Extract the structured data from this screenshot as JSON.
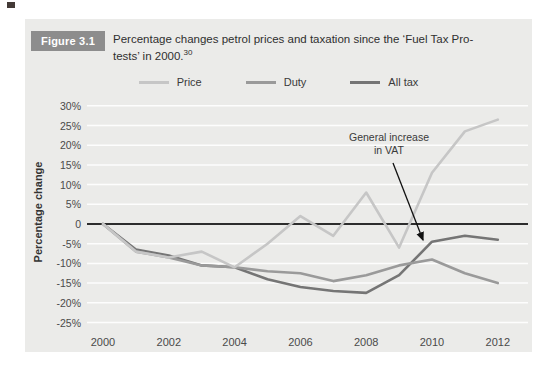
{
  "figure": {
    "badge": "Figure 3.1",
    "caption_line1": "Percentage changes petrol prices and taxation since the ‘Fuel Tax Pro-",
    "caption_line2": "tests’ in 2000.",
    "caption_superscript": "30"
  },
  "legend": [
    {
      "label": "Price",
      "color": "#c6c6c6"
    },
    {
      "label": "Duty",
      "color": "#9a9a9a"
    },
    {
      "label": "All tax",
      "color": "#757575"
    }
  ],
  "annotation": {
    "line1": "General increase",
    "line2": "in VAT"
  },
  "colors": {
    "panel_bg": "#ebebe9",
    "gridline": "#fdfdfd",
    "zero_line": "#2d2d2d",
    "axis_text": "#4a4a4a",
    "arrow": "#111111"
  },
  "chart_data": {
    "type": "line",
    "xlabel": "",
    "ylabel": "Percentage change",
    "ylim": [
      -25,
      30
    ],
    "grid": true,
    "legend_position": "top",
    "x": [
      2000,
      2001,
      2002,
      2003,
      2004,
      2005,
      2006,
      2007,
      2008,
      2009,
      2010,
      2011,
      2012
    ],
    "series": [
      {
        "name": "Price",
        "values": [
          0,
          -7,
          -8.5,
          -7,
          -11,
          -5,
          2,
          -3,
          8,
          -6,
          13,
          23.5,
          26.5
        ]
      },
      {
        "name": "Duty",
        "values": [
          0,
          -7,
          -8.5,
          -10.5,
          -11,
          -12,
          -12.5,
          -14.5,
          -13,
          -10.5,
          -9,
          -12.5,
          -15
        ]
      },
      {
        "name": "All tax",
        "values": [
          0,
          -6.5,
          -8,
          -10.5,
          -11,
          -14,
          -16,
          -17,
          -17.5,
          -13,
          -4.5,
          -3,
          -4
        ]
      }
    ],
    "xticks": [
      2000,
      2002,
      2004,
      2006,
      2008,
      2010,
      2012
    ],
    "yticks": [
      {
        "value": 30,
        "label": "30%"
      },
      {
        "value": 25,
        "label": "25%"
      },
      {
        "value": 20,
        "label": "20%"
      },
      {
        "value": 15,
        "label": "15%"
      },
      {
        "value": 10,
        "label": "10%"
      },
      {
        "value": 5,
        "label": "5%"
      },
      {
        "value": 0,
        "label": "0"
      },
      {
        "value": -5,
        "label": "-5%"
      },
      {
        "value": -10,
        "label": "-10%"
      },
      {
        "value": -15,
        "label": "-15%"
      },
      {
        "value": -20,
        "label": "-20%"
      },
      {
        "value": -25,
        "label": "-25%"
      }
    ],
    "annotation_text": "General increase in VAT",
    "annotation_points_to": {
      "series": "All tax",
      "x": 2010
    }
  }
}
